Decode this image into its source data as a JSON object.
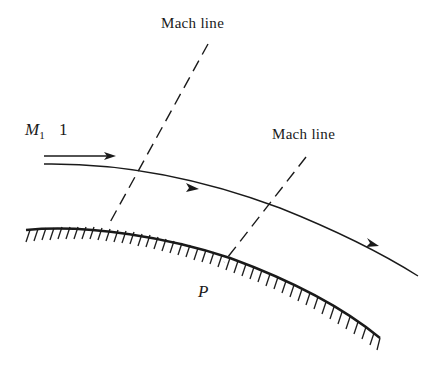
{
  "diagram": {
    "labels": {
      "mach_line_1": "Mach line",
      "mach_line_2": "Mach line",
      "freestream_symbol": "M",
      "freestream_subscript": "1",
      "freestream_value": "1",
      "point": "P"
    },
    "elements": [
      "freestream arrow",
      "streamline with two arrowheads",
      "curved convex wall with hatching",
      "dashed Mach line 1",
      "dashed Mach line 2",
      "point P on wall"
    ],
    "colors": {
      "ink": "#1a1a1a",
      "background": "#ffffff"
    }
  }
}
